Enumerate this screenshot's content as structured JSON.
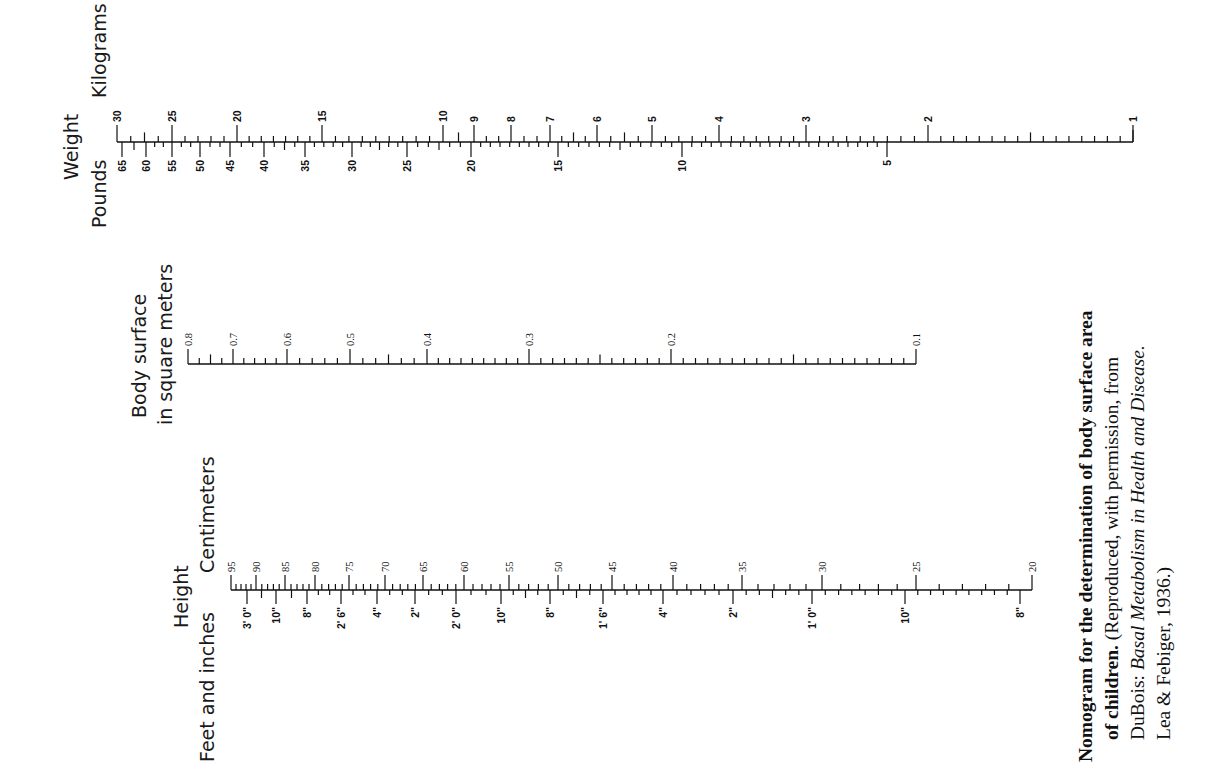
{
  "chart_data": {
    "type": "nomogram",
    "title": "Nomogram for the determination of body surface area of children.",
    "orientation": "rotated 90° counter-clockwise",
    "scales": [
      {
        "name": "weight",
        "title": "Weight",
        "upper_unit": "Kilograms",
        "lower_unit": "Pounds",
        "kilograms": [
          {
            "v": "30",
            "x": 117
          },
          {
            "v": "25",
            "x": 172
          },
          {
            "v": "20",
            "x": 237
          },
          {
            "v": "15",
            "x": 322
          },
          {
            "v": "10",
            "x": 443
          },
          {
            "v": "9",
            "x": 474
          },
          {
            "v": "8",
            "x": 511
          },
          {
            "v": "7",
            "x": 550
          },
          {
            "v": "6",
            "x": 597
          },
          {
            "v": "5",
            "x": 652
          },
          {
            "v": "4",
            "x": 719
          },
          {
            "v": "3",
            "x": 806
          },
          {
            "v": "2",
            "x": 928
          },
          {
            "v": "1",
            "x": 1133
          }
        ],
        "pounds": [
          {
            "v": "65",
            "x": 122
          },
          {
            "v": "60",
            "x": 146
          },
          {
            "v": "55",
            "x": 172
          },
          {
            "v": "50",
            "x": 200
          },
          {
            "v": "45",
            "x": 230
          },
          {
            "v": "40",
            "x": 264
          },
          {
            "v": "35",
            "x": 305
          },
          {
            "v": "30",
            "x": 352
          },
          {
            "v": "25",
            "x": 407
          },
          {
            "v": "20",
            "x": 471
          },
          {
            "v": "15",
            "x": 558
          },
          {
            "v": "10",
            "x": 682
          },
          {
            "v": "5",
            "x": 887
          }
        ],
        "range_kg": [
          1,
          30
        ],
        "range_lb": [
          2.2,
          66
        ]
      },
      {
        "name": "body-surface",
        "title": "Body surface",
        "subtitle": "in square meters",
        "values": [
          {
            "v": "0.8",
            "x": 188
          },
          {
            "v": "0.7",
            "x": 233
          },
          {
            "v": "0.6",
            "x": 287
          },
          {
            "v": "0.5",
            "x": 350
          },
          {
            "v": "0.4",
            "x": 427
          },
          {
            "v": "0.3",
            "x": 529
          },
          {
            "v": "0.2",
            "x": 671
          },
          {
            "v": "0.1",
            "x": 916
          }
        ],
        "range_m2": [
          0.1,
          0.8
        ]
      },
      {
        "name": "height",
        "title": "Height",
        "upper_unit": "Centimeters",
        "lower_unit": "Feet and inches",
        "centimeters": [
          {
            "v": "95",
            "x": 231
          },
          {
            "v": "90",
            "x": 256
          },
          {
            "v": "85",
            "x": 285
          },
          {
            "v": "80",
            "x": 315
          },
          {
            "v": "75",
            "x": 349
          },
          {
            "v": "70",
            "x": 385
          },
          {
            "v": "65",
            "x": 423
          },
          {
            "v": "60",
            "x": 464
          },
          {
            "v": "55",
            "x": 509
          },
          {
            "v": "50",
            "x": 558
          },
          {
            "v": "45",
            "x": 612
          },
          {
            "v": "40",
            "x": 673
          },
          {
            "v": "35",
            "x": 742
          },
          {
            "v": "30",
            "x": 822
          },
          {
            "v": "25",
            "x": 916
          },
          {
            "v": "20",
            "x": 1032
          }
        ],
        "feet_inches": [
          {
            "v": "3' 0\"",
            "x": 247
          },
          {
            "v": "10\"",
            "x": 276
          },
          {
            "v": "8\"",
            "x": 307
          },
          {
            "v": "2' 6\"",
            "x": 341
          },
          {
            "v": "4\"",
            "x": 377
          },
          {
            "v": "2\"",
            "x": 415
          },
          {
            "v": "2' 0\"",
            "x": 456
          },
          {
            "v": "10\"",
            "x": 501
          },
          {
            "v": "8\"",
            "x": 550
          },
          {
            "v": "1' 6\"",
            "x": 603
          },
          {
            "v": "4\"",
            "x": 663
          },
          {
            "v": "2\"",
            "x": 733
          },
          {
            "v": "1' 0\"",
            "x": 812
          },
          {
            "v": "10\"",
            "x": 905
          },
          {
            "v": "8\"",
            "x": 1020
          }
        ],
        "range_cm": [
          20,
          95
        ]
      }
    ]
  },
  "labels": {
    "weight_title": "Weight",
    "weight_kg_unit": "Kilograms",
    "weight_lb_unit": "Pounds",
    "surface_title": "Body surface",
    "surface_subtitle": "in square meters",
    "height_title": "Height",
    "height_cm_unit": "Centimeters",
    "height_ftin_unit": "Feet and inches"
  },
  "caption": {
    "line1_bold": "Nomogram for the determination of body surface area",
    "line2_bold": "of children.",
    "line2_rest": " (Reproduced, with permission, from",
    "line3_plain": "DuBois: ",
    "line3_italic": "Basal Metabolism in Health and Disease.",
    "line4": "Lea & Febiger, 1936.)"
  }
}
